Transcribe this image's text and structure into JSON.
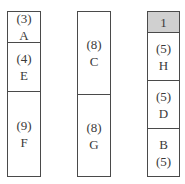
{
  "columns": [
    {
      "cells": [
        {
          "line1": "(3)",
          "line2": "A",
          "shaded": false
        },
        {
          "line1": "(4)",
          "line2": "E",
          "shaded": false
        },
        {
          "line1": "(9)",
          "line2": "F",
          "shaded": false
        }
      ]
    },
    {
      "cells": [
        {
          "line1": "(8)",
          "line2": "C",
          "shaded": false
        },
        {
          "line1": "(8)",
          "line2": "G",
          "shaded": false
        }
      ]
    },
    {
      "cells": [
        {
          "line1": "1",
          "line2": "",
          "shaded": true
        },
        {
          "line1": "(5)",
          "line2": "H",
          "shaded": false
        },
        {
          "line1": "(5)",
          "line2": "D",
          "shaded": false
        },
        {
          "line1": "B",
          "line2": "(5)",
          "shaded": false
        }
      ]
    }
  ],
  "colors": {
    "border": "#4a4a4a",
    "shaded": "#d0d0d0",
    "text": "#3a3a3a"
  }
}
